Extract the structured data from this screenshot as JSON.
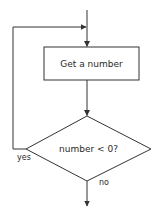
{
  "diagram": {
    "type": "flowchart",
    "nodes": [
      {
        "id": "get_number",
        "shape": "rectangle",
        "label": "Get a number"
      },
      {
        "id": "check_negative",
        "shape": "diamond",
        "label": "number < 0?"
      }
    ],
    "edges": [
      {
        "from": "start",
        "to": "get_number",
        "label": ""
      },
      {
        "from": "get_number",
        "to": "check_negative",
        "label": ""
      },
      {
        "from": "check_negative",
        "to": "get_number",
        "label": "yes"
      },
      {
        "from": "check_negative",
        "to": "end",
        "label": "no"
      }
    ],
    "labels": {
      "box": "Get a number",
      "decision": "number < 0?",
      "yes": "yes",
      "no": "no"
    },
    "colors": {
      "stroke": "#333333",
      "background": "#ffffff"
    }
  }
}
